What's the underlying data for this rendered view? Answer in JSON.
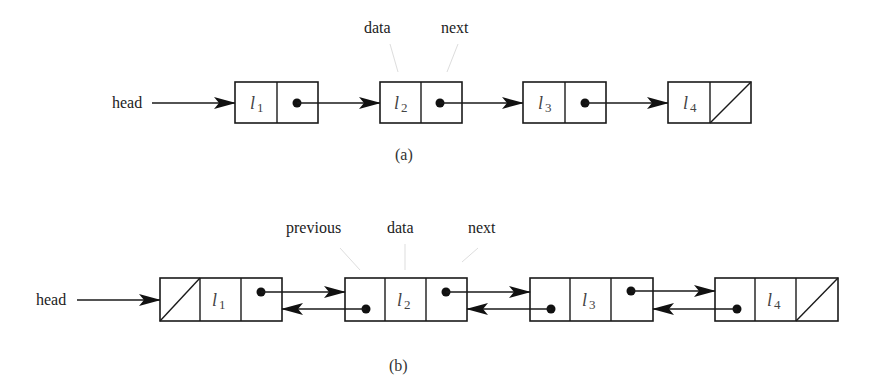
{
  "diagram_a": {
    "caption": "(a)",
    "type": "singly-linked-list",
    "head_label": "head",
    "field_labels": {
      "data": "data",
      "next": "next"
    },
    "nodes": [
      {
        "var": "l",
        "sub": "1",
        "next": "pointer"
      },
      {
        "var": "l",
        "sub": "2",
        "next": "pointer"
      },
      {
        "var": "l",
        "sub": "3",
        "next": "pointer"
      },
      {
        "var": "l",
        "sub": "4",
        "next": "null"
      }
    ]
  },
  "diagram_b": {
    "caption": "(b)",
    "type": "doubly-linked-list",
    "head_label": "head",
    "field_labels": {
      "previous": "previous",
      "data": "data",
      "next": "next"
    },
    "nodes": [
      {
        "var": "l",
        "sub": "1",
        "previous": "null",
        "next": "pointer"
      },
      {
        "var": "l",
        "sub": "2",
        "previous": "pointer",
        "next": "pointer"
      },
      {
        "var": "l",
        "sub": "3",
        "previous": "pointer",
        "next": "pointer"
      },
      {
        "var": "l",
        "sub": "4",
        "previous": "pointer",
        "next": "null"
      }
    ]
  },
  "colors": {
    "stroke": "#1a1a1a",
    "text": "#222222",
    "background": "#ffffff"
  }
}
